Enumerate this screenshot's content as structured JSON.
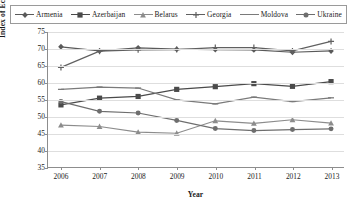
{
  "chart_data": {
    "type": "line",
    "title": "",
    "xlabel": "Year",
    "ylabel": "Index of Economic Freedom",
    "categories": [
      2006,
      2007,
      2008,
      2009,
      2010,
      2011,
      2012,
      2013
    ],
    "x_tick_labels": [
      "2006",
      "2007",
      "2008",
      "2009",
      "2010",
      "2011",
      "2012",
      "2013"
    ],
    "y_tick_labels": [
      "35",
      "40",
      "45",
      "50",
      "55",
      "60",
      "65",
      "70",
      "75"
    ],
    "y_ticks": [
      35,
      40,
      45,
      50,
      55,
      60,
      65,
      70,
      75
    ],
    "ylim": [
      35,
      75
    ],
    "grid": "horizontal",
    "legend_position": "top",
    "series": [
      {
        "name": "Armenia",
        "marker": "diamond",
        "color": "#5a5a5a",
        "values": [
          70.6,
          69.4,
          70.3,
          69.9,
          69.8,
          69.7,
          69.0,
          69.4
        ]
      },
      {
        "name": "Azerbaijan",
        "marker": "square",
        "color": "#4a4a4a",
        "values": [
          53.4,
          55.4,
          55.9,
          58.0,
          58.8,
          59.7,
          58.9,
          60.3
        ]
      },
      {
        "name": "Belarus",
        "marker": "triangle",
        "color": "#8c8c8c",
        "values": [
          47.4,
          47.0,
          45.3,
          45.0,
          48.7,
          47.9,
          49.0,
          48.0
        ]
      },
      {
        "name": "Georgia",
        "marker": "plus",
        "color": "#606060",
        "values": [
          64.5,
          69.3,
          69.7,
          69.8,
          70.4,
          70.4,
          69.4,
          72.2
        ]
      },
      {
        "name": "Moldova",
        "marker": "line",
        "color": "#7a7a7a",
        "values": [
          58.0,
          58.7,
          58.4,
          54.9,
          53.7,
          55.7,
          54.4,
          55.5
        ]
      },
      {
        "name": "Ukraine",
        "marker": "circle",
        "color": "#6e6e6e",
        "values": [
          54.4,
          51.5,
          51.0,
          48.8,
          46.4,
          45.8,
          46.1,
          46.3
        ]
      }
    ]
  }
}
